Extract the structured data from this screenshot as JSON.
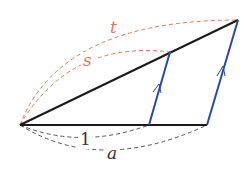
{
  "diagram": {
    "labels": {
      "t": "t",
      "s": "s",
      "one": "1",
      "a": "a"
    },
    "colors": {
      "black_line": "#1a1a1a",
      "blue_line": "#2a4aa0",
      "red_dashed": "#e2765a",
      "gray_dashed": "#555555"
    },
    "points": {
      "O": [
        20,
        125
      ],
      "P1": [
        149,
        125
      ],
      "A": [
        207,
        125
      ],
      "S": [
        170,
        52
      ],
      "T": [
        238,
        20
      ]
    }
  }
}
